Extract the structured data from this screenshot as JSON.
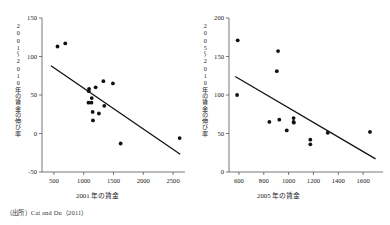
{
  "figure": {
    "source_note": "（出所）Cai and Du（2011）",
    "point_color": "#111111",
    "line_color": "#111111",
    "axis_color": "#555555",
    "background": "#ffffff"
  },
  "chart_data": [
    {
      "type": "scatter",
      "title": "",
      "xlabel": "2001 年の賃金",
      "ylabel": "2001〜2010年の賃金の伸び率",
      "xlim": [
        300,
        2700
      ],
      "ylim": [
        -50,
        150
      ],
      "xticks": [
        500,
        1000,
        1500,
        2000,
        2500
      ],
      "yticks": [
        -50,
        0,
        50,
        100,
        150
      ],
      "grid": false,
      "legend": "none",
      "points": [
        {
          "x": 560,
          "y": 113
        },
        {
          "x": 690,
          "y": 117
        },
        {
          "x": 1090,
          "y": 58
        },
        {
          "x": 1085,
          "y": 55
        },
        {
          "x": 1080,
          "y": 40
        },
        {
          "x": 1130,
          "y": 40
        },
        {
          "x": 1135,
          "y": 46
        },
        {
          "x": 1150,
          "y": 28
        },
        {
          "x": 1155,
          "y": 17
        },
        {
          "x": 1200,
          "y": 60
        },
        {
          "x": 1255,
          "y": 26
        },
        {
          "x": 1330,
          "y": 68
        },
        {
          "x": 1345,
          "y": 36
        },
        {
          "x": 1490,
          "y": 65
        },
        {
          "x": 1620,
          "y": -13
        },
        {
          "x": 2610,
          "y": -6
        }
      ],
      "trendline": {
        "x0": 450,
        "y0": 88,
        "x1": 2620,
        "y1": -27
      }
    },
    {
      "type": "scatter",
      "title": "",
      "xlabel": "2005 年の賃金",
      "ylabel": "2005〜2010年の賃金の伸び率",
      "xlim": [
        520,
        1760
      ],
      "ylim": [
        0,
        200
      ],
      "xticks": [
        600,
        800,
        1000,
        1200,
        1400,
        1600
      ],
      "yticks": [
        0,
        50,
        100,
        150,
        200
      ],
      "grid": false,
      "legend": "none",
      "points": [
        {
          "x": 590,
          "y": 171
        },
        {
          "x": 585,
          "y": 100
        },
        {
          "x": 845,
          "y": 65
        },
        {
          "x": 905,
          "y": 131
        },
        {
          "x": 915,
          "y": 157
        },
        {
          "x": 925,
          "y": 68
        },
        {
          "x": 985,
          "y": 54
        },
        {
          "x": 1040,
          "y": 70
        },
        {
          "x": 1040,
          "y": 65
        },
        {
          "x": 1042,
          "y": 64
        },
        {
          "x": 1175,
          "y": 42
        },
        {
          "x": 1175,
          "y": 36
        },
        {
          "x": 1315,
          "y": 51
        },
        {
          "x": 1655,
          "y": 52
        }
      ],
      "trendline": {
        "x0": 570,
        "y0": 124,
        "x1": 1700,
        "y1": 17
      }
    }
  ]
}
